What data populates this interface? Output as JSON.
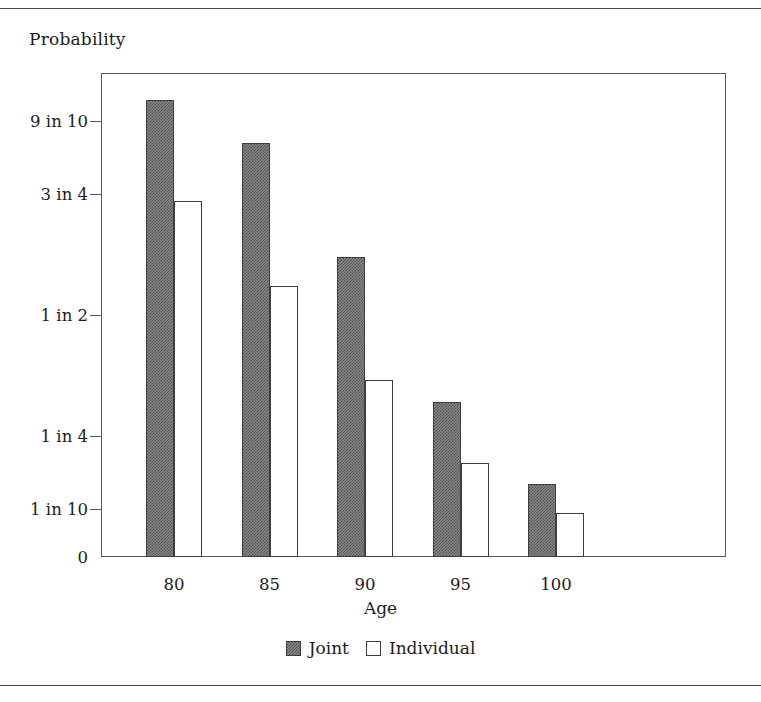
{
  "rules": {
    "top": "horizontal-rule",
    "bottom": "horizontal-rule"
  },
  "chart_data": {
    "type": "bar",
    "title": "",
    "ylabel": "Probability",
    "xlabel": "Age",
    "categories": [
      "80",
      "85",
      "90",
      "95",
      "100"
    ],
    "series": [
      {
        "name": "Joint",
        "values": [
          0.945,
          0.855,
          0.62,
          0.32,
          0.15
        ]
      },
      {
        "name": "Individual",
        "values": [
          0.735,
          0.56,
          0.365,
          0.195,
          0.09
        ]
      }
    ],
    "ytick_labels": [
      "0",
      "1 in 10",
      "1 in 4",
      "1 in 2",
      "3 in 4",
      "9 in 10"
    ],
    "ytick_values": [
      0,
      0.1,
      0.25,
      0.5,
      0.75,
      0.9
    ],
    "ylim": [
      0,
      1.0
    ],
    "grid": false,
    "legend_position": "bottom",
    "colors": {
      "joint": "#8a8a8a",
      "individual": "#ffffff",
      "outline": "#3d3d3d",
      "axis": "#5a5a5a"
    }
  },
  "legend": {
    "items": [
      {
        "label": "Joint",
        "swatch": "joint-swatch"
      },
      {
        "label": "Individual",
        "swatch": "individual-swatch"
      }
    ]
  }
}
